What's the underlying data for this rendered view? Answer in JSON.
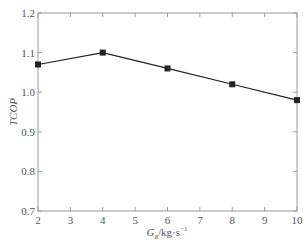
{
  "chart_data": {
    "type": "line",
    "title": "",
    "xlabel": "G_a/kg·s⁻¹",
    "xlabel_parts": {
      "main": "G",
      "sub": "a",
      "unit": "/kg·s",
      "sup": "−1"
    },
    "ylabel": "TCOP",
    "x": [
      2,
      4,
      6,
      8,
      10
    ],
    "series": [
      {
        "name": "TCOP",
        "values": [
          1.07,
          1.1,
          1.06,
          1.02,
          0.98
        ],
        "marker": "square",
        "color": "#222222"
      }
    ],
    "xlim": [
      2,
      10
    ],
    "ylim": [
      0.7,
      1.2
    ],
    "xticks": [
      2,
      3,
      4,
      5,
      6,
      7,
      8,
      9,
      10
    ],
    "yticks": [
      "0.7",
      "0.8",
      "0.9",
      "1.0",
      "1.1",
      "1.2"
    ],
    "grid": false,
    "legend": null,
    "frame": "box",
    "tick_direction": "in"
  },
  "colors": {
    "axis": "#9a9a9a",
    "line": "#222222",
    "text": "#555555"
  }
}
